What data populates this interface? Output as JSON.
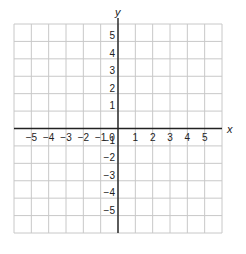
{
  "chart_data": {
    "type": "scatter",
    "title": "",
    "xlabel": "x",
    "ylabel": "y",
    "xlim": [
      -6,
      6
    ],
    "ylim": [
      -6,
      6
    ],
    "grid": true,
    "x_ticks": [
      -5,
      -4,
      -3,
      -2,
      -1,
      0,
      1,
      2,
      3,
      4,
      5
    ],
    "y_ticks": [
      -5,
      -4,
      -3,
      -2,
      -1,
      1,
      2,
      3,
      4,
      5
    ],
    "x_tick_labels": [
      "−5",
      "−4",
      "−3",
      "−2",
      "−1",
      "0",
      "1",
      "2",
      "3",
      "4",
      "5"
    ],
    "y_tick_labels": [
      "−5",
      "−4",
      "−3",
      "−2",
      "−1",
      "1",
      "2",
      "3",
      "4",
      "5"
    ],
    "series": [],
    "legend": null
  },
  "colors": {
    "grid": "#c8c8c8",
    "axis": "#222222",
    "text": "#222222"
  },
  "layout": {
    "left": 14,
    "right": 222,
    "top": 24,
    "bottom": 233,
    "cells": 12
  }
}
